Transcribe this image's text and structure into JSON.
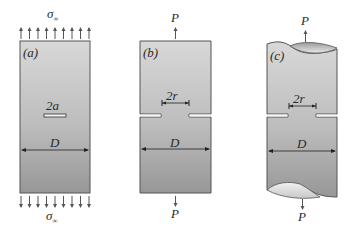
{
  "figure": {
    "panels": [
      {
        "id": "a",
        "label": "(a)",
        "crack_label": "2a",
        "width_label": "D",
        "top_load_label": "σ",
        "top_load_sub": "∞",
        "bottom_load_label": "σ",
        "bottom_load_sub": "∞",
        "description": "Plate with central crack under uniform remote tension"
      },
      {
        "id": "b",
        "label": "(b)",
        "ligament_label": "2r",
        "width_label": "D",
        "top_load_label": "P",
        "bottom_load_label": "P",
        "description": "Double-edge notched plate under point load"
      },
      {
        "id": "c",
        "label": "(c)",
        "ligament_label": "2r",
        "width_label": "D",
        "top_load_label": "P",
        "bottom_load_label": "P",
        "description": "Circumferentially notched round bar under point load"
      }
    ],
    "colors": {
      "fill_top": "#d6d6d6",
      "fill_bottom": "#9a9a9a",
      "outline": "#4a4a4a",
      "text": "#2a2a2a"
    }
  }
}
